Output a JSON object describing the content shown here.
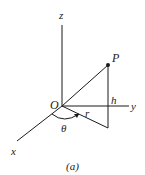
{
  "figure": {
    "caption": "(a)",
    "type": "cylindrical coordinates diagram",
    "labels": {
      "z_axis": "z",
      "y_axis": "y",
      "x_axis": "x",
      "origin": "O",
      "point": "P",
      "height": "h",
      "radius": "r",
      "angle": "θ"
    }
  }
}
